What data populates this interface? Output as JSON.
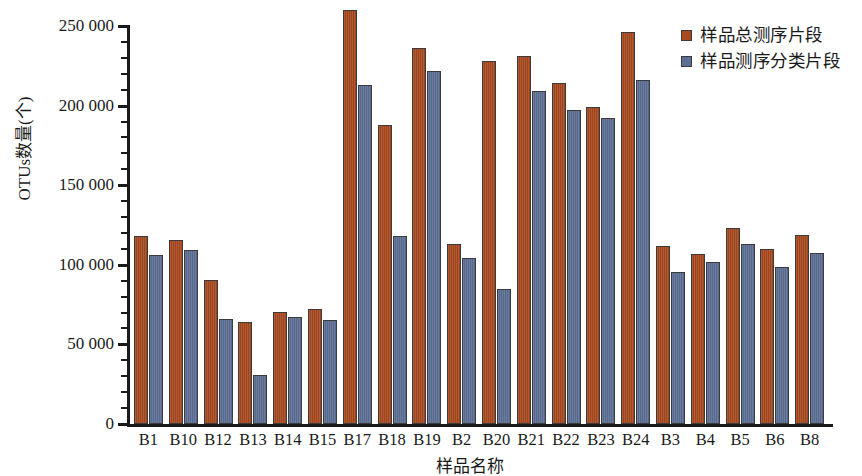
{
  "chart_data": {
    "type": "bar",
    "title": "",
    "xlabel": "样品名称",
    "ylabel": "OTUs数量(个)",
    "ylim": [
      0,
      265000
    ],
    "yticks": [
      0,
      50000,
      100000,
      150000,
      200000,
      250000
    ],
    "ytick_labels": [
      "0",
      "50 000",
      "100 000",
      "150 000",
      "200 000",
      "250 000"
    ],
    "minor_ticks_per_interval": 4,
    "grid": false,
    "legend_position": "top-right",
    "categories": [
      "B1",
      "B10",
      "B12",
      "B13",
      "B14",
      "B15",
      "B17",
      "B18",
      "B19",
      "B2",
      "B20",
      "B21",
      "B22",
      "B23",
      "B24",
      "B3",
      "B4",
      "B5",
      "B6",
      "B8"
    ],
    "series": [
      {
        "name": "样品总测序片段",
        "color": "#a8491f",
        "values": [
          118000,
          115500,
          90500,
          64000,
          70500,
          72000,
          260000,
          188000,
          236000,
          113000,
          228000,
          231000,
          214000,
          199000,
          246000,
          112000,
          107000,
          123000,
          110000,
          119000
        ]
      },
      {
        "name": "样品测序分类片段",
        "color": "#5c6f95",
        "values": [
          106000,
          109000,
          66000,
          30500,
          67000,
          65500,
          213000,
          118000,
          222000,
          104500,
          85000,
          209000,
          197500,
          192000,
          216000,
          95500,
          101500,
          113000,
          98500,
          107500
        ]
      }
    ]
  },
  "legend": {
    "items": [
      {
        "label": "样品总测序片段",
        "color": "#a8491f"
      },
      {
        "label": "样品测序分类片段",
        "color": "#5c6f95"
      }
    ]
  },
  "axes": {
    "y_title": "OTUs数量(个)",
    "x_title": "样品名称"
  }
}
